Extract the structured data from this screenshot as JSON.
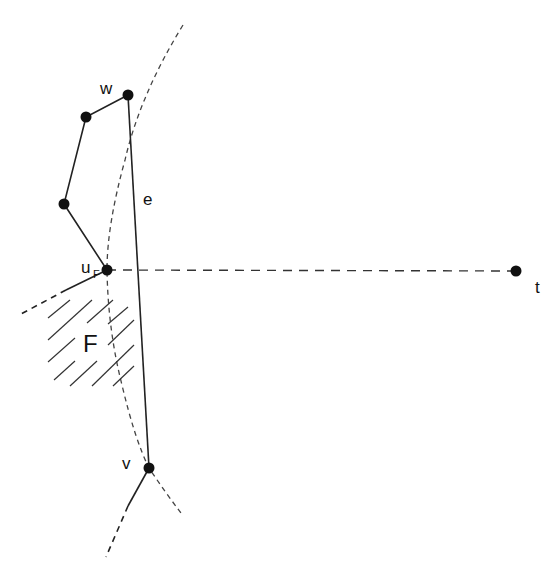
{
  "diagram": {
    "labels": {
      "w": "w",
      "e": "e",
      "u": "u",
      "u_sub": "F",
      "F": "F",
      "v": "v",
      "t": "t"
    },
    "nodes": [
      {
        "id": "w",
        "x": 128,
        "y": 95
      },
      {
        "id": "p1",
        "x": 86,
        "y": 117
      },
      {
        "id": "p2",
        "x": 64,
        "y": 204
      },
      {
        "id": "uF",
        "x": 107,
        "y": 270
      },
      {
        "id": "v",
        "x": 149,
        "y": 468
      },
      {
        "id": "t",
        "x": 516,
        "y": 271
      }
    ],
    "edges": [
      {
        "from": "w",
        "to": "p1",
        "style": "solid"
      },
      {
        "from": "p1",
        "to": "p2",
        "style": "solid"
      },
      {
        "from": "p2",
        "to": "uF",
        "style": "solid"
      },
      {
        "from": "w",
        "to": "v",
        "style": "solid",
        "label": "e"
      },
      {
        "from": "uF",
        "to": "t",
        "style": "dashed"
      }
    ],
    "colors": {
      "stroke": "#222222",
      "dashed_curve": "#444444",
      "hatch": "#333333",
      "node": "#111111"
    }
  }
}
